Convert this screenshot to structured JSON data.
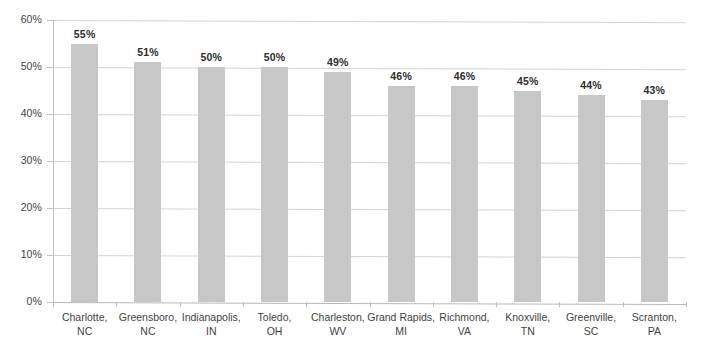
{
  "chart_data": {
    "type": "bar",
    "title": "",
    "subtitle": "",
    "xlabel": "",
    "ylabel": "",
    "ylim": [
      0,
      60
    ],
    "ytick_values": [
      0,
      10,
      20,
      30,
      40,
      50,
      60
    ],
    "ytick_labels": [
      "0%",
      "10%",
      "20%",
      "30%",
      "40%",
      "50%",
      "60%"
    ],
    "grid": true,
    "legend": "none",
    "bar_color": "#c7c7c7",
    "gridline_color": "#d4d4d4",
    "categories": [
      "Charlotte, NC",
      "Greensboro, NC",
      "Indianapolis, IN",
      "Toledo, OH",
      "Charleston, WV",
      "Grand Rapids, MI",
      "Richmond, VA",
      "Knoxville, TN",
      "Greenville, SC",
      "Scranton, PA"
    ],
    "category_lines": [
      [
        "Charlotte,",
        "NC"
      ],
      [
        "Greensboro,",
        "NC"
      ],
      [
        "Indianapolis,",
        "IN"
      ],
      [
        "Toledo,",
        "OH"
      ],
      [
        "Charleston,",
        "WV"
      ],
      [
        "Grand Rapids,",
        "MI"
      ],
      [
        "Richmond,",
        "VA"
      ],
      [
        "Knoxville,",
        "TN"
      ],
      [
        "Greenville,",
        "SC"
      ],
      [
        "Scranton,",
        "PA"
      ]
    ],
    "values": [
      55,
      51,
      50,
      50,
      49,
      46,
      46,
      45,
      44,
      43
    ],
    "value_labels": [
      "55%",
      "51%",
      "50%",
      "50%",
      "49%",
      "46%",
      "46%",
      "45%",
      "44%",
      "43%"
    ]
  }
}
